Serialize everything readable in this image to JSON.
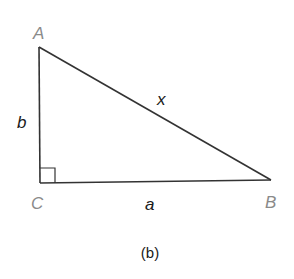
{
  "figure": {
    "caption": "(b)",
    "line_color": "#333333",
    "vertex_label_color": "#8a8a8a",
    "side_label_color": "#1a1a1a"
  },
  "triangle": {
    "vertices": {
      "A": {
        "label": "A",
        "x": 39,
        "y": 47
      },
      "B": {
        "label": "B",
        "x": 271,
        "y": 180
      },
      "C": {
        "label": "C",
        "x": 40,
        "y": 183
      }
    },
    "sides": {
      "b": {
        "label": "b",
        "from": "A",
        "to": "C"
      },
      "a": {
        "label": "a",
        "from": "C",
        "to": "B"
      },
      "x": {
        "label": "x",
        "from": "A",
        "to": "B"
      }
    },
    "right_angle_at": "C"
  }
}
